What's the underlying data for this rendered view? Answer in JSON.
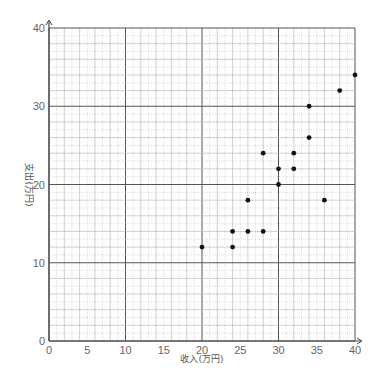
{
  "chart_data": {
    "type": "scatter",
    "title": "",
    "xlabel": "收入(万円)",
    "ylabel": "支出(万円)",
    "xlim": [
      0,
      40
    ],
    "ylim": [
      0,
      40
    ],
    "x_ticks": [
      0,
      5,
      10,
      15,
      20,
      25,
      30,
      35,
      40
    ],
    "y_ticks": [
      0,
      10,
      20,
      30,
      40
    ],
    "grid": {
      "major_step": 10,
      "medium_step": 2,
      "minor_step": 1
    },
    "legend": null,
    "series": [
      {
        "name": "data",
        "points": [
          {
            "x": 20,
            "y": 12
          },
          {
            "x": 24,
            "y": 12
          },
          {
            "x": 24,
            "y": 14
          },
          {
            "x": 26,
            "y": 14
          },
          {
            "x": 28,
            "y": 14
          },
          {
            "x": 26,
            "y": 18
          },
          {
            "x": 28,
            "y": 24
          },
          {
            "x": 30,
            "y": 20
          },
          {
            "x": 30,
            "y": 22
          },
          {
            "x": 32,
            "y": 22
          },
          {
            "x": 32,
            "y": 24
          },
          {
            "x": 34,
            "y": 26
          },
          {
            "x": 34,
            "y": 30
          },
          {
            "x": 36,
            "y": 18
          },
          {
            "x": 38,
            "y": 32
          },
          {
            "x": 40,
            "y": 34
          }
        ]
      }
    ]
  },
  "style": {
    "point_color": "#111111",
    "major_grid": "#555555",
    "minor_grid": "#bbbbbb",
    "axis_color": "#444444"
  }
}
